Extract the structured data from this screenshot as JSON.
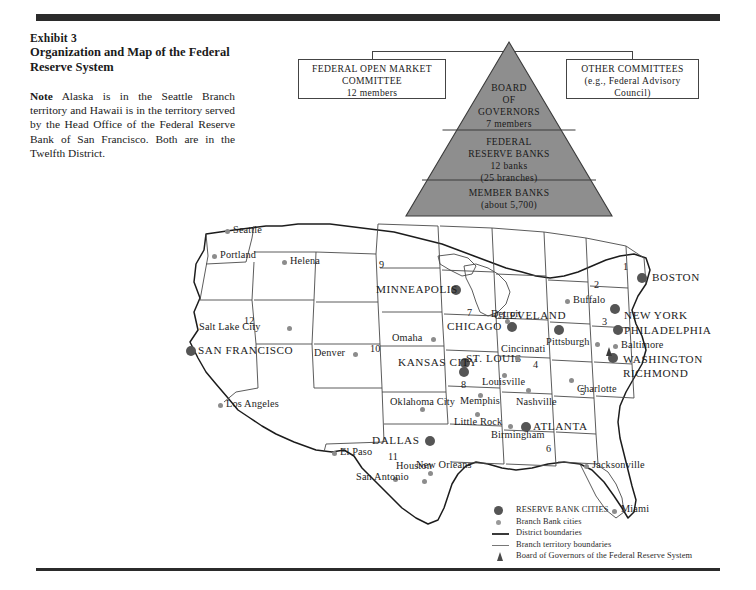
{
  "exhibit": {
    "label": "Exhibit 3",
    "title": "Organization and Map of the Federal Reserve System",
    "note_lead": "Note",
    "note_text": " Alaska is in the Seattle Branch territory and Hawaii is in the territory served by the Head Office of the Federal Reserve Bank of San Francisco.  Both are in the Twelfth District."
  },
  "diagram": {
    "fomc": {
      "line1": "FEDERAL  OPEN  MARKET",
      "line2": "COMMITTEE",
      "line3": "12 members"
    },
    "other": {
      "line1": "OTHER  COMMITTEES",
      "line2": "(e.g., Federal Advisory",
      "line3": "Council)"
    },
    "pyramid_fill": "#8e8e8e",
    "tiers": [
      {
        "name": "board-of-governors",
        "lines": [
          "BOARD",
          "OF",
          "GOVERNORS",
          "7 members"
        ]
      },
      {
        "name": "federal-reserve-banks",
        "lines": [
          "FEDERAL",
          "RESERVE BANKS",
          "12 banks",
          "(25 branches)"
        ]
      },
      {
        "name": "member-banks",
        "lines": [
          "MEMBER BANKS",
          "(about 5,700)"
        ]
      }
    ]
  },
  "map": {
    "reserve_cities": [
      {
        "name": "SAN FRANCISCO",
        "lx": 18,
        "ly": 135,
        "dx": 10,
        "dy": 134
      },
      {
        "name": "MINNEAPOLIS",
        "lx": 201,
        "ly": 75,
        "dx": 275,
        "dy": 73
      },
      {
        "name": "CHICAGO",
        "lx": 271,
        "ly": 112,
        "dx": 331,
        "dy": 110
      },
      {
        "name": "KANSAS CITY",
        "lx": 224,
        "ly": 148,
        "lx2": 232,
        "ly2": 160,
        "dx": 284,
        "dy": 146
      },
      {
        "name": "ST. LOUIS",
        "lx": 283,
        "ly": 142,
        "dx": 283,
        "dy": 155
      },
      {
        "name": "DALLAS",
        "lx": 195,
        "ly": 225,
        "dx": 249,
        "dy": 224
      },
      {
        "name": "ATLANTA",
        "lx": 371,
        "ly": 212,
        "dx": 357,
        "dy": 205
      },
      {
        "name": "CLEVELAND",
        "lx": 382,
        "ly": 100,
        "dx": 382,
        "dy": 113
      },
      {
        "name": "BOSTON",
        "lx": 486,
        "ly": 62,
        "dx": 465,
        "dy": 62
      },
      {
        "name": "NEW YORK",
        "lx": 452,
        "ly": 99,
        "dx": 437,
        "dy": 93
      },
      {
        "name": "PHILADELPHIA",
        "lx": 452,
        "ly": 115,
        "dx": 439,
        "dy": 117
      },
      {
        "name": "WASHINGTON",
        "lx": 450,
        "ly": 144,
        "dx": 435,
        "dy": 145
      },
      {
        "name": "RICHMOND",
        "lx": 450,
        "ly": 158,
        "dx": 436,
        "dy": 157
      }
    ],
    "branch_cities": [
      {
        "name": "Seattle",
        "lx": 58,
        "ly": 14,
        "dx": 51,
        "dy": 18
      },
      {
        "name": "Portland",
        "lx": 44,
        "ly": 39,
        "dx": 37,
        "dy": 43
      },
      {
        "name": "Helena",
        "lx": 114,
        "ly": 45,
        "dx": 107,
        "dy": 49
      },
      {
        "name": "Salt Lake City",
        "lx": 23,
        "ly": 111,
        "dx": 112,
        "dy": 115
      },
      {
        "name": "Denver",
        "lx": 139,
        "ly": 137,
        "dx": 178,
        "dy": 141
      },
      {
        "name": "Los Angeles",
        "lx": 50,
        "ly": 188,
        "dx": 43,
        "dy": 192
      },
      {
        "name": "Omaha",
        "lx": 216,
        "ly": 122,
        "dx": 256,
        "dy": 126
      },
      {
        "name": "Oklahoma City",
        "lx": 219,
        "ly": 186,
        "lx2": 236,
        "ly2": 197,
        "dx": 245,
        "dy": 196
      },
      {
        "name": "El Paso",
        "lx": 165,
        "ly": 236,
        "dx": 157,
        "dy": 240
      },
      {
        "name": "Houston",
        "lx": 222,
        "ly": 250,
        "dx": 253,
        "dy": 260
      },
      {
        "name": "San Antonio",
        "lx": 185,
        "ly": 261,
        "lx2": 180,
        "ly2": 273,
        "dx": 218,
        "dy": 266
      },
      {
        "name": "New Orleans",
        "lx": 250,
        "ly": 249,
        "lx2": 243,
        "ly2": 261,
        "dx": 247,
        "dy": 268
      },
      {
        "name": "Little Rock",
        "lx": 286,
        "ly": 206,
        "lx2": 288,
        "ly2": 217,
        "dx": 300,
        "dy": 201
      },
      {
        "name": "Memphis",
        "lx": 287,
        "ly": 185,
        "dx": 303,
        "dy": 182
      },
      {
        "name": "Birmingham",
        "lx": 316,
        "ly": 219,
        "dx": 333,
        "dy": 213
      },
      {
        "name": "Nashville",
        "lx": 345,
        "ly": 186,
        "dx": 351,
        "dy": 177
      },
      {
        "name": "Louisville",
        "lx": 307,
        "ly": 166,
        "dx": 327,
        "dy": 162
      },
      {
        "name": "Cincinnati",
        "lx": 328,
        "ly": 133,
        "dx": 340,
        "dy": 145
      },
      {
        "name": "Detroit",
        "lx": 316,
        "ly": 98,
        "dx": 330,
        "dy": 108
      },
      {
        "name": "Pittsburgh",
        "lx": 364,
        "ly": 126,
        "dx": 420,
        "dy": 131
      },
      {
        "name": "Buffalo",
        "lx": 397,
        "ly": 84,
        "dx": 390,
        "dy": 88
      },
      {
        "name": "Baltimore",
        "lx": 446,
        "ly": 130,
        "dx": 438,
        "dy": 133
      },
      {
        "name": "Charlotte",
        "lx": 400,
        "ly": 174,
        "dx": 394,
        "dy": 167
      },
      {
        "name": "Jacksonville",
        "lx": 417,
        "ly": 249,
        "dx": 409,
        "dy": 253
      },
      {
        "name": "Miami",
        "lx": 446,
        "ly": 294,
        "dx": 437,
        "dy": 298
      }
    ],
    "district_numbers": [
      {
        "n": "1",
        "x": 447,
        "y": 50
      },
      {
        "n": "2",
        "x": 418,
        "y": 68
      },
      {
        "n": "3",
        "x": 426,
        "y": 105
      },
      {
        "n": "4",
        "x": 357,
        "y": 148
      },
      {
        "n": "5",
        "x": 404,
        "y": 175
      },
      {
        "n": "6",
        "x": 370,
        "y": 232
      },
      {
        "n": "7",
        "x": 291,
        "y": 96
      },
      {
        "n": "8",
        "x": 285,
        "y": 168
      },
      {
        "n": "9",
        "x": 203,
        "y": 48
      },
      {
        "n": "10",
        "x": 194,
        "y": 132
      },
      {
        "n": "11",
        "x": 212,
        "y": 240
      },
      {
        "n": "12",
        "x": 68,
        "y": 104
      }
    ],
    "legend": [
      {
        "marker": "reserve-dot",
        "text": "RESERVE BANK CITIES"
      },
      {
        "marker": "branch-dot",
        "text": "Branch Bank cities"
      },
      {
        "marker": "solid-line",
        "text": "District boundaries"
      },
      {
        "marker": "thin-line",
        "text": "Branch territory boundaries"
      },
      {
        "marker": "triangle",
        "text": "Board of Governors of the Federal Reserve System"
      }
    ]
  }
}
